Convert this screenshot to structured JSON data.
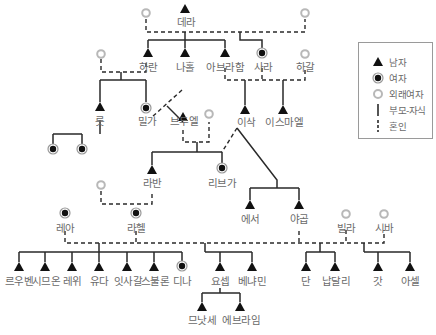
{
  "legend": {
    "male": "남자",
    "female": "여자",
    "foreign_woman": "외래여자",
    "parent_child": "부모-자식",
    "marriage": "혼인"
  },
  "colors": {
    "line": "#2a2a2a",
    "symbol": "#111111",
    "foreign": "#b8b8b8",
    "label": "#6a6a6a",
    "border": "#9a9a9a"
  },
  "people": {
    "terah": "데라",
    "haran": "하란",
    "nahor": "나홀",
    "abraham": "아브라함",
    "sarah": "사라",
    "hagar": "하갈",
    "lot": "롯",
    "milcah": "밀가",
    "bethuel": "브두엘",
    "isaac": "이삭",
    "ishmael": "이스마엘",
    "laban": "라반",
    "rebekah": "리브가",
    "esau": "에서",
    "jacob": "야곱",
    "leah": "레아",
    "rachel": "라헬",
    "bilhah": "빌라",
    "zilpah": "시바",
    "reuben": "르우벤",
    "simeon": "시므온",
    "levi": "레위",
    "judah": "유다",
    "issachar": "잇사갈",
    "zebulun": "스불론",
    "dinah": "디나",
    "joseph": "요셉",
    "benjamin": "베냐민",
    "dan": "단",
    "naphtali": "납달리",
    "gad": "갓",
    "asher": "아셀",
    "manasseh": "므낫세",
    "ephraim": "에브라임"
  }
}
